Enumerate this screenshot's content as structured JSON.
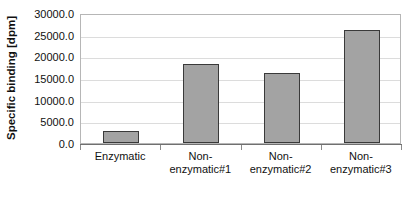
{
  "chart_data": {
    "type": "bar",
    "title": "",
    "subtitle": "",
    "xlabel": "",
    "ylabel": "Specific binding [dpm]",
    "categories": [
      "Enzymatic",
      "Non-\nenzymatic#1",
      "Non-\nenzymatic#2",
      "Non-\nenzymatic#3"
    ],
    "category_labels_flat": [
      "Enzymatic",
      "Non-enzymatic#1",
      "Non-enzymatic#2",
      "Non-enzymatic#3"
    ],
    "values": [
      2800,
      18300,
      16200,
      26100
    ],
    "series": [
      {
        "name": "Specific binding",
        "values": [
          2800,
          18300,
          16200,
          26100
        ]
      }
    ],
    "ylim": [
      0,
      30000
    ],
    "ytick_values": [
      0,
      5000,
      10000,
      15000,
      20000,
      25000,
      30000
    ],
    "ytick_labels": [
      "0.0",
      "5000.0",
      "10000.0",
      "15000.0",
      "20000.0",
      "25000.0",
      "30000.0"
    ],
    "grid": true,
    "grid_axis": "y",
    "legend": false,
    "legend_position": "none",
    "bar_fill_color": "#a3a3a3",
    "bar_border_color": "#3a3a3a",
    "gridline_color": "#dcdcdc",
    "frame_color": "#b6b6b6",
    "axis_color": "#8a8a8a",
    "text_color": "#111111",
    "background_color": "#ffffff"
  }
}
